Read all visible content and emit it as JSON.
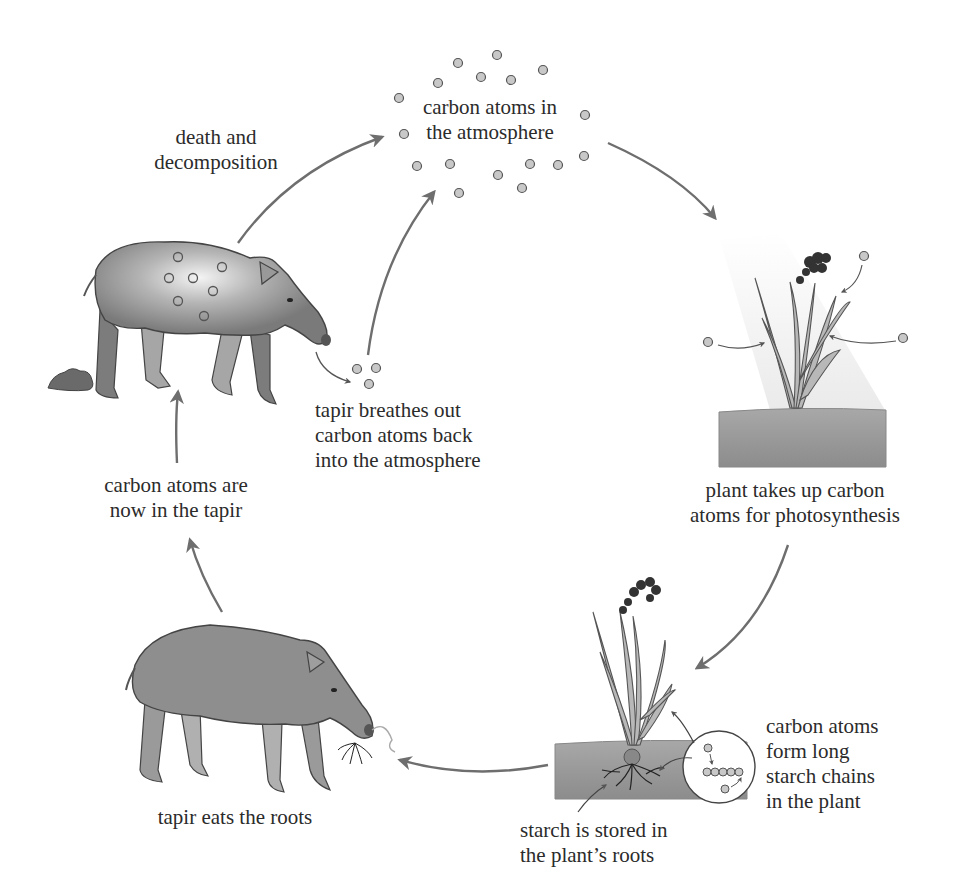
{
  "diagram": {
    "colors": {
      "arrow": "#6e6e6e",
      "atom_fill": "#c8c8c8",
      "atom_stroke": "#555555",
      "tapir_body": "#8a8a8a",
      "tapir_highlight": "#f2f2f2",
      "soil": "#9a9a9a",
      "sunlight": "#eeeeee",
      "text": "#2b2b2b"
    },
    "labels": {
      "atmosphere": {
        "line1": "carbon atoms in",
        "line2": "the atmosphere"
      },
      "death": {
        "line1": "death and",
        "line2": "decomposition"
      },
      "breathes": {
        "line1": "tapir breathes out",
        "line2": "carbon atoms back",
        "line3": "into the atmosphere"
      },
      "plant_uptake": {
        "line1": "plant takes up carbon",
        "line2": "atoms for photosynthesis"
      },
      "starch_chains": {
        "line1": "carbon atoms",
        "line2": "form long",
        "line3": "starch chains",
        "line4": "in the plant"
      },
      "starch_stored": {
        "line1": "starch is stored in",
        "line2": "the plant’s roots"
      },
      "tapir_eats": {
        "line1": "tapir eats the roots"
      },
      "in_tapir": {
        "line1": "carbon atoms are",
        "line2": "now in the tapir"
      }
    },
    "nodes": [
      {
        "id": "atmosphere",
        "icon": "carbon-atoms-cloud"
      },
      {
        "id": "plant-photosynthesis",
        "icon": "plant-in-sunlight"
      },
      {
        "id": "plant-starch",
        "icon": "plant-with-roots"
      },
      {
        "id": "tapir-eating",
        "icon": "tapir-eating-roots"
      },
      {
        "id": "tapir-carbon",
        "icon": "tapir-with-carbon-atoms"
      }
    ],
    "flow": [
      "atmosphere -> plant takes up carbon",
      "plant -> starch stored in roots",
      "roots -> tapir eats the roots",
      "tapir eats -> carbon atoms now in tapir",
      "tapir -> breathes out to atmosphere",
      "tapir -> death and decomposition -> atmosphere"
    ]
  }
}
